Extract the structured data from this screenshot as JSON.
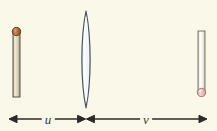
{
  "figure": {
    "background_color": "#faf8e8",
    "width": 217,
    "height": 131
  },
  "object": {
    "name": "object-arrow",
    "label": "",
    "body_color": "#d8d3b4",
    "body_highlight": "#efeddc",
    "outline_color": "#4a4636",
    "tip_color": "#a8673c",
    "tip_highlight": "#c9895c",
    "x": 16.5,
    "top_y": 28,
    "bottom_y": 97,
    "width": 7
  },
  "lens": {
    "name": "converging-lens",
    "label": "",
    "fill_color": "#fbfbf4",
    "outline_color": "#4a5a6e",
    "center_x": 86,
    "top_y": 11,
    "bottom_y": 108,
    "half_width": 5.5
  },
  "image": {
    "name": "image-arrow",
    "label": "",
    "body_color": "#f3f1e2",
    "body_highlight": "#ffffff",
    "outline_color": "#6a6a5c",
    "tip_color": "#e5b8b4",
    "tip_highlight": "#f3d6d2",
    "x": 201.5,
    "top_y": 31,
    "bottom_y": 94,
    "width": 7
  },
  "dimensions": {
    "axis_y": 119,
    "line_color": "#2b2b28",
    "object_distance": {
      "name": "object-distance",
      "label": "u",
      "start_x": 9,
      "end_x": 86,
      "label_x": 48
    },
    "image_distance": {
      "name": "image-distance",
      "label": "v",
      "start_x": 86,
      "end_x": 207,
      "label_x": 146
    }
  }
}
